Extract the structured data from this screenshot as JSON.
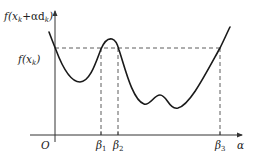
{
  "diagram": {
    "type": "function-plot",
    "colors": {
      "curve": "#1a1a1a",
      "axes": "#333333",
      "dashed": "#333333",
      "text": "#222222",
      "background": "#ffffff"
    },
    "labels": {
      "y_axis": "f(x",
      "y_axis_sub_k": "k",
      "y_axis_mid": "+αd",
      "y_axis_sub_k2": "k",
      "y_axis_close": ")",
      "level_prefix": "f(x",
      "level_sub": "k",
      "level_close": ")",
      "origin": "O",
      "x_axis": "α",
      "beta1": "β",
      "beta1_sub": "1",
      "beta2": "β",
      "beta2_sub": "2",
      "beta3": "β",
      "beta3_sub": "3"
    },
    "y_axis_full_label": "f(x_k+αd_k)",
    "level_full_label": "f(x_k)",
    "x_ticks": [
      "β1",
      "β2",
      "β3"
    ],
    "curve_features": [
      "starts above level f(x_k) left of origin",
      "crosses level at alpha=0",
      "local minimum below level",
      "crosses level upward at β1",
      "local maximum between β1 and β2",
      "crosses level downward at β2",
      "two local minima with small bump",
      "crosses level upward at β3 and continues rising"
    ]
  }
}
